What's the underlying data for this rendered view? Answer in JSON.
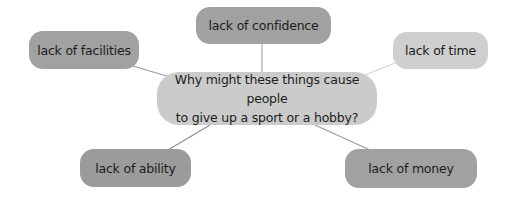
{
  "diagram": {
    "type": "mind-map",
    "center": {
      "line1": "Why might these things cause people",
      "line2": "to give up a sport or a hobby?"
    },
    "nodes": [
      {
        "id": "confidence",
        "label": "lack of confidence",
        "shade": "dark"
      },
      {
        "id": "facilities",
        "label": "lack of facilities",
        "shade": "dark"
      },
      {
        "id": "time",
        "label": "lack of time",
        "shade": "light"
      },
      {
        "id": "ability",
        "label": "lack of ability",
        "shade": "dark"
      },
      {
        "id": "money",
        "label": "lack of money",
        "shade": "dark"
      }
    ],
    "colors": {
      "dark_node": "#a1a1a1",
      "light_node": "#cfcfcf",
      "center_node": "#cbcbcb",
      "connector": "#9a9a9a",
      "text": "#1c1c1c"
    }
  }
}
